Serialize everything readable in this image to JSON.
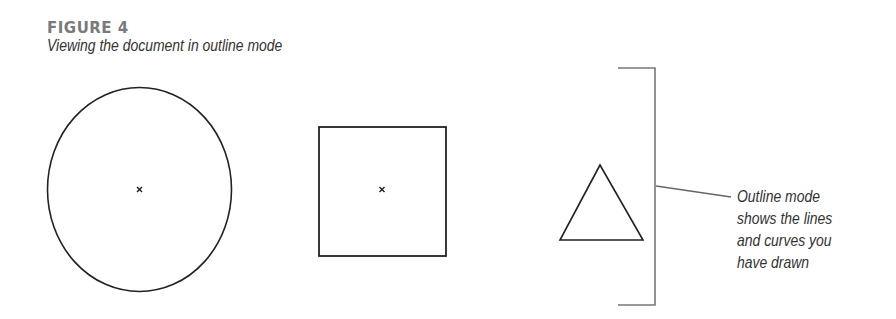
{
  "figure": {
    "label": "FIGURE 4",
    "subtitle": "Viewing the document in outline mode"
  },
  "shapes": [
    {
      "type": "ellipse",
      "name": "circle",
      "cx": 139.5,
      "cy": 189.5,
      "rx": 92,
      "ry": 102,
      "center_marker": true
    },
    {
      "type": "rect",
      "name": "square",
      "x": 319,
      "y": 127,
      "width": 127,
      "height": 129,
      "center_marker": true
    },
    {
      "type": "triangle",
      "name": "triangle",
      "points": "600,165 560,240 643,240",
      "center_marker": false
    }
  ],
  "callout": {
    "lines": [
      "Outline mode",
      "shows the lines",
      "and curves you",
      "have drawn"
    ],
    "bracket_color": "#777777",
    "line_color": "#333333"
  }
}
